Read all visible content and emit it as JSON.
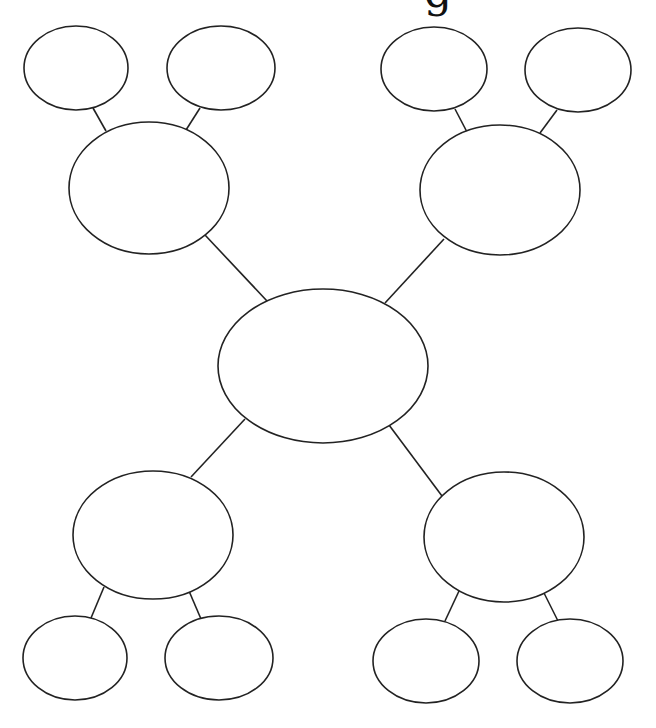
{
  "title": {
    "visible_fragment": "g"
  },
  "style": {
    "stroke": "#222222",
    "fill": "#ffffff",
    "stroke_width": 1.6
  },
  "diagram": {
    "type": "mind-map",
    "nodes": [
      {
        "id": "center",
        "cx": 323,
        "cy": 366,
        "rx": 105,
        "ry": 77,
        "label": ""
      },
      {
        "id": "branch-top-left",
        "cx": 149,
        "cy": 188,
        "rx": 80,
        "ry": 66,
        "label": ""
      },
      {
        "id": "branch-top-right",
        "cx": 500,
        "cy": 190,
        "rx": 80,
        "ry": 65,
        "label": ""
      },
      {
        "id": "branch-bottom-left",
        "cx": 153,
        "cy": 535,
        "rx": 80,
        "ry": 64,
        "label": ""
      },
      {
        "id": "branch-bottom-right",
        "cx": 504,
        "cy": 537,
        "rx": 80,
        "ry": 65,
        "label": ""
      },
      {
        "id": "leaf-tl-1",
        "cx": 76,
        "cy": 68,
        "rx": 52,
        "ry": 42,
        "label": ""
      },
      {
        "id": "leaf-tl-2",
        "cx": 221,
        "cy": 68,
        "rx": 54,
        "ry": 42,
        "label": ""
      },
      {
        "id": "leaf-tr-1",
        "cx": 434,
        "cy": 69,
        "rx": 53,
        "ry": 42,
        "label": ""
      },
      {
        "id": "leaf-tr-2",
        "cx": 578,
        "cy": 70,
        "rx": 53,
        "ry": 42,
        "label": ""
      },
      {
        "id": "leaf-bl-1",
        "cx": 75,
        "cy": 658,
        "rx": 52,
        "ry": 42,
        "label": ""
      },
      {
        "id": "leaf-bl-2",
        "cx": 219,
        "cy": 658,
        "rx": 54,
        "ry": 42,
        "label": ""
      },
      {
        "id": "leaf-br-1",
        "cx": 426,
        "cy": 661,
        "rx": 53,
        "ry": 42,
        "label": ""
      },
      {
        "id": "leaf-br-2",
        "cx": 570,
        "cy": 661,
        "rx": 53,
        "ry": 42,
        "label": ""
      }
    ],
    "edges": [
      {
        "x1": 205,
        "y1": 235,
        "x2": 267,
        "y2": 301
      },
      {
        "x1": 444,
        "y1": 239,
        "x2": 385,
        "y2": 303
      },
      {
        "x1": 245,
        "y1": 419,
        "x2": 191,
        "y2": 477
      },
      {
        "x1": 389,
        "y1": 425,
        "x2": 442,
        "y2": 496
      },
      {
        "x1": 93,
        "y1": 108,
        "x2": 106,
        "y2": 131
      },
      {
        "x1": 200,
        "y1": 108,
        "x2": 186,
        "y2": 130
      },
      {
        "x1": 455,
        "y1": 109,
        "x2": 467,
        "y2": 132
      },
      {
        "x1": 557,
        "y1": 110,
        "x2": 540,
        "y2": 133
      },
      {
        "x1": 104,
        "y1": 587,
        "x2": 91,
        "y2": 618
      },
      {
        "x1": 189,
        "y1": 591,
        "x2": 201,
        "y2": 619
      },
      {
        "x1": 459,
        "y1": 591,
        "x2": 445,
        "y2": 621
      },
      {
        "x1": 544,
        "y1": 593,
        "x2": 558,
        "y2": 621
      }
    ]
  }
}
